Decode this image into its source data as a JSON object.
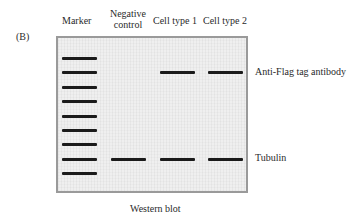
{
  "panel_label": "(B)",
  "lanes": [
    {
      "label_line1": "Marker",
      "label_line2": ""
    },
    {
      "label_line1": "Negative",
      "label_line2": "control"
    },
    {
      "label_line1": "Cell type 1",
      "label_line2": ""
    },
    {
      "label_line1": "Cell type 2",
      "label_line2": ""
    }
  ],
  "band_labels": {
    "flag": "Anti-Flag tag antibody",
    "tubulin": "Tubulin"
  },
  "caption": "Western blot",
  "colors": {
    "band": "#1a1a1a",
    "gel_bg": "#efefef",
    "gel_border": "#9a9a9a"
  }
}
